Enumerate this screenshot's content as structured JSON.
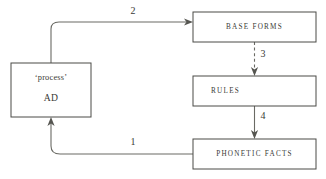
{
  "diagram": {
    "background_color": "#ffffff",
    "line_color": "#6a6a64",
    "box_border_color": "#4a4a46",
    "text_color": "#3a3a36",
    "nodes": [
      {
        "id": "ad",
        "line1": "‘process’",
        "line2": "AD",
        "x": 11,
        "y": 63,
        "width": 80,
        "height": 54
      },
      {
        "id": "base_forms",
        "label": "BASE FORMS",
        "x": 193,
        "y": 12,
        "width": 123,
        "height": 30
      },
      {
        "id": "rules",
        "label": "RULES",
        "x": 193,
        "y": 76,
        "width": 123,
        "height": 30
      },
      {
        "id": "phonetic_facts",
        "label": "PHONETIC FACTS",
        "x": 193,
        "y": 139,
        "width": 123,
        "height": 30
      }
    ],
    "edges": [
      {
        "id": "edge-2",
        "label": "2",
        "from": "ad",
        "to": "base_forms",
        "style": "solid",
        "direction": "right"
      },
      {
        "id": "edge-3",
        "label": "3",
        "from": "base_forms",
        "to": "rules",
        "style": "dashed",
        "direction": "down"
      },
      {
        "id": "edge-4",
        "label": "4",
        "from": "rules",
        "to": "phonetic_facts",
        "style": "solid",
        "direction": "down"
      },
      {
        "id": "edge-1",
        "label": "1",
        "from": "phonetic_facts",
        "to": "ad",
        "style": "solid",
        "direction": "up"
      }
    ]
  }
}
